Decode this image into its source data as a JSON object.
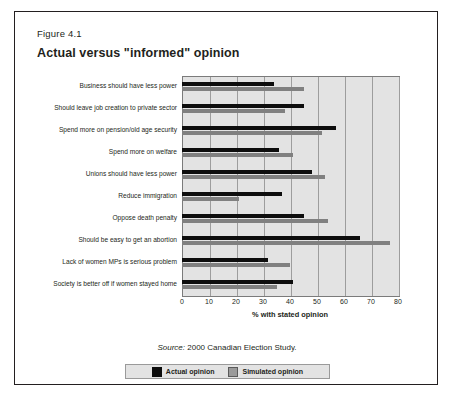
{
  "figure": {
    "number": "Figure 4.1",
    "title": "Actual versus \"informed\" opinion",
    "source_word": "Source:",
    "source_text": " 2000 Canadian Election Study."
  },
  "legend": {
    "actual_label": "Actual opinion",
    "simulated_label": "Simulated opinion",
    "actual_color": "#0d0d0d",
    "simulated_color": "#808080"
  },
  "chart_data": {
    "type": "bar",
    "orientation": "horizontal",
    "title": "Actual versus \"informed\" opinion",
    "subtitle": "Figure 4.1",
    "xlabel": "% with stated opinion",
    "ylabel": "",
    "xlim": [
      0,
      80
    ],
    "xticks": [
      0,
      10,
      20,
      30,
      40,
      50,
      60,
      70,
      80
    ],
    "grid": true,
    "legend_position": "bottom",
    "categories": [
      "Business should have less power",
      "Should leave job creation to private sector",
      "Spend more on pension/old age security",
      "Spend more on welfare",
      "Unions should have less power",
      "Reduce immigration",
      "Oppose death penalty",
      "Should be easy to get an abortion",
      "Lack of women MPs is serious problem",
      "Society is better off if women stayed home"
    ],
    "series": [
      {
        "name": "Actual opinion",
        "color": "#0d0d0d",
        "values": [
          34,
          45,
          57,
          36,
          48,
          37,
          45,
          66,
          32,
          41
        ]
      },
      {
        "name": "Simulated opinion",
        "color": "#808080",
        "values": [
          45,
          38,
          52,
          41,
          53,
          21,
          54,
          77,
          40,
          35
        ]
      }
    ]
  }
}
